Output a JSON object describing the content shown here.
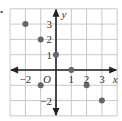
{
  "chart_data": {
    "type": "scatter",
    "title": "",
    "xlabel": "x",
    "ylabel": "y",
    "origin_label": "O",
    "xlim": [
      -3,
      4
    ],
    "ylim": [
      -3,
      4
    ],
    "grid": true,
    "x_tick_labels": [
      "−2",
      "2",
      "3"
    ],
    "x_tick_values": [
      -2,
      2,
      3
    ],
    "x_tick_label_one": "1",
    "y_tick_labels": [
      "3",
      "2",
      "1",
      "−2"
    ],
    "y_tick_values": [
      3,
      2,
      1,
      -2
    ],
    "points": [
      {
        "x": -2,
        "y": 3
      },
      {
        "x": -1,
        "y": 2
      },
      {
        "x": 0,
        "y": 1
      },
      {
        "x": 1,
        "y": 0
      },
      {
        "x": -1,
        "y": -1
      },
      {
        "x": 2,
        "y": -1
      },
      {
        "x": 3,
        "y": -2
      }
    ],
    "colors": {
      "grid": "#c8c8c8",
      "axis": "#222222",
      "point": "#666666",
      "text": "#333333"
    }
  },
  "bullet": "•"
}
